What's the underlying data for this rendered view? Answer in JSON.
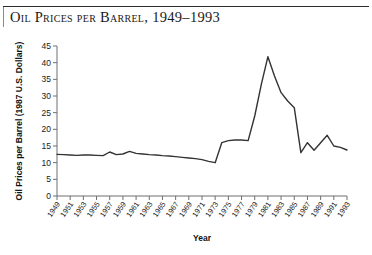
{
  "figure": {
    "title": "Oil Prices per Barrel, 1949–1993",
    "accent_color": "#333333",
    "axis_color": "#6e6e6e",
    "rule_color": "#2b2b2b"
  },
  "chart_data": {
    "type": "line",
    "title": "Oil Prices per Barrel, 1949–1993",
    "xlabel": "Year",
    "ylabel": "Oil Prices per Barrel (1987 U.S. Dollars)",
    "xlim": [
      1949,
      1993
    ],
    "ylim": [
      0,
      45
    ],
    "yticks": [
      0,
      5,
      10,
      15,
      20,
      25,
      30,
      35,
      40,
      45
    ],
    "xticks": [
      1949,
      1951,
      1953,
      1955,
      1957,
      1959,
      1961,
      1963,
      1965,
      1967,
      1969,
      1971,
      1973,
      1975,
      1977,
      1979,
      1981,
      1983,
      1985,
      1987,
      1989,
      1991,
      1993
    ],
    "grid": false,
    "legend": "none",
    "series": [
      {
        "name": "Oil Prices per Barrel (1987 U.S. Dollars)",
        "x": [
          1949,
          1950,
          1951,
          1952,
          1953,
          1954,
          1955,
          1956,
          1957,
          1958,
          1959,
          1960,
          1961,
          1962,
          1963,
          1964,
          1965,
          1966,
          1967,
          1968,
          1969,
          1970,
          1971,
          1972,
          1973,
          1974,
          1975,
          1976,
          1977,
          1978,
          1979,
          1980,
          1981,
          1982,
          1983,
          1984,
          1985,
          1986,
          1987,
          1988,
          1989,
          1990,
          1991,
          1992,
          1993
        ],
        "values": [
          12.5,
          12.4,
          12.3,
          12.2,
          12.3,
          12.3,
          12.2,
          12.1,
          13.2,
          12.4,
          12.6,
          13.4,
          12.8,
          12.6,
          12.4,
          12.3,
          12.1,
          12.0,
          11.8,
          11.6,
          11.4,
          11.2,
          10.9,
          10.4,
          10.0,
          16.0,
          16.6,
          16.8,
          16.8,
          16.6,
          24.0,
          33.5,
          41.8,
          36.0,
          31.0,
          28.5,
          26.5,
          13.0,
          16.0,
          13.7,
          16.0,
          18.2,
          15.0,
          14.6,
          13.8
        ]
      }
    ]
  }
}
